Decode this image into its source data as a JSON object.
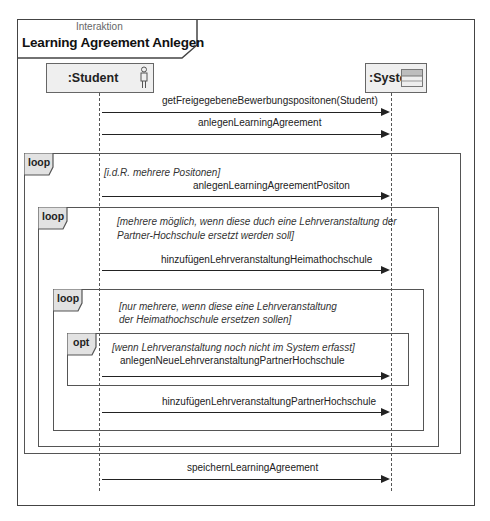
{
  "diagram": {
    "kind_label": "Interaktion",
    "title": "Learning Agreement Anlegen",
    "lifelines": [
      {
        "name": ":Student",
        "icon": "actor-icon"
      },
      {
        "name": ":System",
        "icon": "class-icon"
      }
    ],
    "messages": [
      {
        "label": "getFreigegebeneBewerbungspositonen(Student)",
        "from": ":Student",
        "to": ":System"
      },
      {
        "label": "anlegenLearningAgreement",
        "from": ":Student",
        "to": ":System"
      },
      {
        "label": "anlegenLearningAgreementPositon",
        "from": ":Student",
        "to": ":System"
      },
      {
        "label": "hinzufügenLehrveranstaltungHeimathochschule",
        "from": ":Student",
        "to": ":System"
      },
      {
        "label": "anlegenNeueLehrveranstaltungPartnerHochschule",
        "from": ":Student",
        "to": ":System"
      },
      {
        "label": "hinzufügenLehrveranstaltungPartnerHochschule",
        "from": ":Student",
        "to": ":System"
      },
      {
        "label": "speichernLearningAgreement",
        "from": ":Student",
        "to": ":System"
      }
    ],
    "fragments": [
      {
        "operator": "loop",
        "guard": "[i.d.R. mehrere Positonen]"
      },
      {
        "operator": "loop",
        "guard_line1": "[mehrere möglich, wenn diese duch eine Lehrveranstaltung der",
        "guard_line2": "Partner-Hochschule ersetzt werden soll]"
      },
      {
        "operator": "loop",
        "guard_line1": "[nur mehrere, wenn diese eine Lehrveranstaltung",
        "guard_line2": "der Heimathochschule ersetzen sollen]"
      },
      {
        "operator": "opt",
        "guard": "[wenn Lehrveranstaltung noch nicht im System erfasst]"
      }
    ]
  }
}
